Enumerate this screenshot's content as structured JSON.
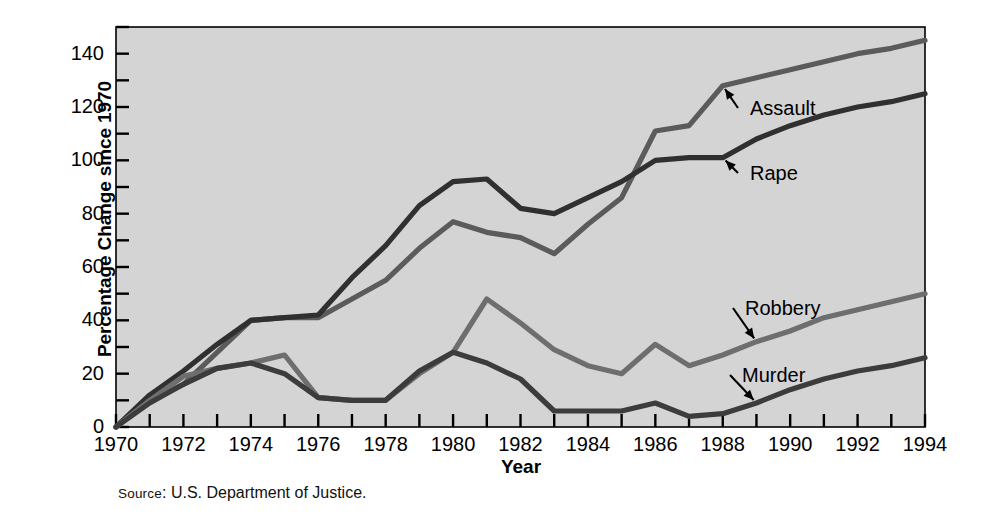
{
  "figure": {
    "source_prefix": "Source",
    "source_text": ": U.S. Department of Justice.",
    "background": "#ffffff",
    "plot_background": "#d4d4d4",
    "axis_color": "#000000"
  },
  "chart_data": {
    "type": "line",
    "title": "",
    "xlabel": "Year",
    "ylabel": "Percentage Change since 1970",
    "xlim": [
      1970,
      1994
    ],
    "ylim": [
      0,
      150
    ],
    "grid": false,
    "legend": "inline-annotations",
    "x_tick_labels": [
      "1970",
      "1972",
      "1974",
      "1976",
      "1978",
      "1980",
      "1982",
      "1984",
      "1986",
      "1988",
      "1990",
      "1992",
      "1994"
    ],
    "x_tick_values": [
      1970,
      1972,
      1974,
      1976,
      1978,
      1980,
      1982,
      1984,
      1986,
      1988,
      1990,
      1992,
      1994
    ],
    "x_minor_tick_values": [
      1971,
      1973,
      1975,
      1977,
      1979,
      1981,
      1983,
      1985,
      1987,
      1989,
      1991,
      1993
    ],
    "y_tick_labels": [
      "0",
      "20",
      "40",
      "60",
      "80",
      "100",
      "120",
      "140"
    ],
    "y_tick_values": [
      0,
      20,
      40,
      60,
      80,
      100,
      120,
      140
    ],
    "y_minor_tick_values": [
      10,
      30,
      50,
      70,
      90,
      110,
      130,
      150
    ],
    "x": [
      1970,
      1971,
      1972,
      1973,
      1974,
      1975,
      1976,
      1977,
      1978,
      1979,
      1980,
      1981,
      1982,
      1983,
      1984,
      1985,
      1986,
      1987,
      1988,
      1989,
      1990,
      1991,
      1992,
      1993,
      1994
    ],
    "series": [
      {
        "name": "Assault",
        "color": "#5b5b5b",
        "values": [
          0,
          10,
          16,
          28,
          40,
          41,
          41,
          48,
          55,
          67,
          77,
          73,
          71,
          65,
          76,
          86,
          111,
          113,
          128,
          131,
          134,
          137,
          140,
          142,
          145
        ]
      },
      {
        "name": "Rape",
        "color": "#303030",
        "values": [
          0,
          12,
          21,
          31,
          40,
          41,
          42,
          56,
          68,
          83,
          92,
          93,
          82,
          80,
          86,
          92,
          100,
          101,
          101,
          108,
          113,
          117,
          120,
          122,
          125
        ]
      },
      {
        "name": "Robbery",
        "color": "#6e6e6e",
        "values": [
          0,
          10,
          19,
          22,
          24,
          27,
          11,
          10,
          10,
          20,
          28,
          48,
          39,
          29,
          23,
          20,
          31,
          23,
          27,
          32,
          36,
          41,
          44,
          47,
          50
        ]
      },
      {
        "name": "Murder",
        "color": "#3c3c3c",
        "values": [
          0,
          9,
          16,
          22,
          24,
          20,
          11,
          10,
          10,
          21,
          28,
          24,
          18,
          6,
          6,
          6,
          9,
          4,
          5,
          9,
          14,
          18,
          21,
          23,
          26
        ]
      }
    ],
    "annotations": [
      {
        "label": "Assault",
        "at_year": 1988,
        "at_value": 128,
        "text_x": 750,
        "text_y": 98
      },
      {
        "label": "Rape",
        "at_year": 1988,
        "at_value": 101,
        "text_x": 750,
        "text_y": 163
      },
      {
        "label": "Robbery",
        "at_year": 1989,
        "at_value": 32,
        "text_x": 745,
        "text_y": 298
      },
      {
        "label": "Murder",
        "at_year": 1989,
        "at_value": 9,
        "text_x": 742,
        "text_y": 365
      }
    ]
  }
}
